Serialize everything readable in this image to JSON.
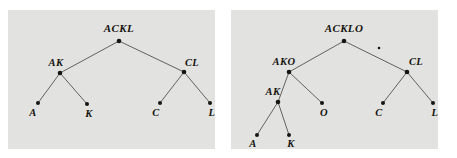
{
  "figure": {
    "background_color": "#ffffff",
    "panel_background_color": "#e2e2e0",
    "edge_color": "#55524e",
    "node_color": "#17150f",
    "label_color": "#15130e"
  },
  "panels": [
    {
      "id": "left",
      "name": "tree-ackl",
      "root_label": "ACKL",
      "nodes": [
        {
          "id": "root",
          "label": "ACKL",
          "x": 111,
          "y": 31,
          "label_x": 111,
          "label_y": 22,
          "label_anchor": "middle",
          "kind": "root"
        },
        {
          "id": "ak",
          "label": "AK",
          "x": 52,
          "y": 63,
          "label_x": 48,
          "label_y": 56,
          "label_anchor": "middle",
          "kind": "internal"
        },
        {
          "id": "cl",
          "label": "CL",
          "x": 176,
          "y": 62,
          "label_x": 184,
          "label_y": 56,
          "label_anchor": "middle",
          "kind": "internal"
        },
        {
          "id": "a",
          "label": "A",
          "x": 30,
          "y": 93,
          "label_x": 25,
          "label_y": 106,
          "label_anchor": "middle",
          "kind": "leaf"
        },
        {
          "id": "k",
          "label": "K",
          "x": 79,
          "y": 94,
          "label_x": 81,
          "label_y": 107,
          "label_anchor": "middle",
          "kind": "leaf"
        },
        {
          "id": "c",
          "label": "C",
          "x": 152,
          "y": 93,
          "label_x": 148,
          "label_y": 106,
          "label_anchor": "middle",
          "kind": "leaf"
        },
        {
          "id": "l",
          "label": "L",
          "x": 202,
          "y": 93,
          "label_x": 204,
          "label_y": 106,
          "label_anchor": "middle",
          "kind": "leaf"
        }
      ],
      "edges": [
        {
          "from": "root",
          "to": "ak"
        },
        {
          "from": "root",
          "to": "cl"
        },
        {
          "from": "ak",
          "to": "a"
        },
        {
          "from": "ak",
          "to": "k"
        },
        {
          "from": "cl",
          "to": "c"
        },
        {
          "from": "cl",
          "to": "l"
        }
      ],
      "stray_marks": []
    },
    {
      "id": "right",
      "name": "tree-acklo",
      "root_label": "ACKLO",
      "nodes": [
        {
          "id": "root",
          "label": "ACKLO",
          "x": 113,
          "y": 31,
          "label_x": 113,
          "label_y": 22,
          "label_anchor": "middle",
          "kind": "root"
        },
        {
          "id": "ako",
          "label": "AKO",
          "x": 58,
          "y": 62,
          "label_x": 53,
          "label_y": 55,
          "label_anchor": "middle",
          "kind": "internal"
        },
        {
          "id": "cl",
          "label": "CL",
          "x": 176,
          "y": 62,
          "label_x": 185,
          "label_y": 55,
          "label_anchor": "middle",
          "kind": "internal"
        },
        {
          "id": "ak",
          "label": "AK",
          "x": 47,
          "y": 92,
          "label_x": 42,
          "label_y": 85,
          "label_anchor": "middle",
          "kind": "internal"
        },
        {
          "id": "o",
          "label": "O",
          "x": 91,
          "y": 93,
          "label_x": 93,
          "label_y": 106,
          "label_anchor": "middle",
          "kind": "leaf"
        },
        {
          "id": "c",
          "label": "C",
          "x": 152,
          "y": 93,
          "label_x": 148,
          "label_y": 106,
          "label_anchor": "middle",
          "kind": "leaf"
        },
        {
          "id": "l",
          "label": "L",
          "x": 202,
          "y": 93,
          "label_x": 204,
          "label_y": 106,
          "label_anchor": "middle",
          "kind": "leaf"
        },
        {
          "id": "a",
          "label": "A",
          "x": 26,
          "y": 125,
          "label_x": 22,
          "label_y": 137,
          "label_anchor": "middle",
          "kind": "leaf"
        },
        {
          "id": "k",
          "label": "K",
          "x": 58,
          "y": 125,
          "label_x": 60,
          "label_y": 137,
          "label_anchor": "middle",
          "kind": "leaf"
        }
      ],
      "edges": [
        {
          "from": "root",
          "to": "ako"
        },
        {
          "from": "root",
          "to": "cl"
        },
        {
          "from": "ako",
          "to": "ak"
        },
        {
          "from": "ako",
          "to": "o"
        },
        {
          "from": "ak",
          "to": "a"
        },
        {
          "from": "ak",
          "to": "k"
        },
        {
          "from": "cl",
          "to": "c"
        },
        {
          "from": "cl",
          "to": "l"
        }
      ],
      "stray_marks": [
        {
          "x": 148,
          "y": 38,
          "r": 1.3
        }
      ]
    }
  ]
}
